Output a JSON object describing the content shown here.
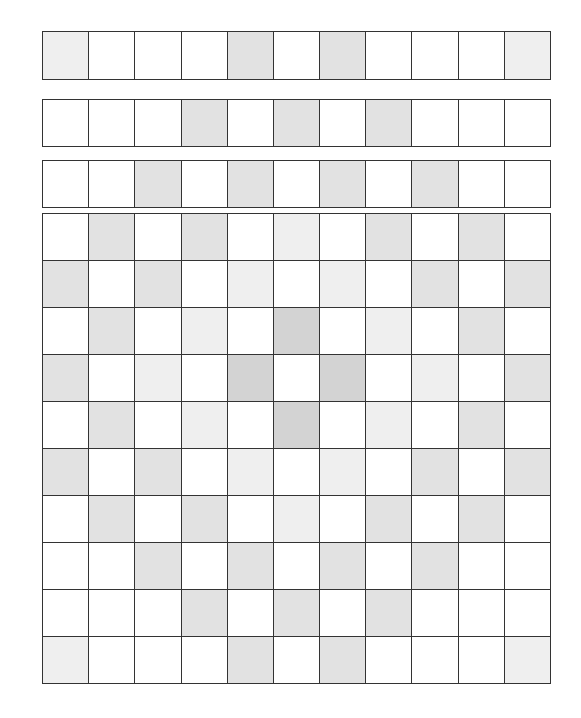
{
  "diagram": {
    "columns": 11,
    "shade_legend": {
      "0": "#ffffff",
      "1": "#efefef",
      "2": "#e2e2e2",
      "3": "#d3d3d3"
    },
    "blocks": [
      {
        "name": "strip-1",
        "top": 31,
        "row_height": 48,
        "rows": [
          [
            1,
            0,
            0,
            0,
            2,
            0,
            2,
            0,
            0,
            0,
            1
          ]
        ]
      },
      {
        "name": "strip-2",
        "top": 99,
        "row_height": 47,
        "rows": [
          [
            0,
            0,
            0,
            2,
            0,
            2,
            0,
            2,
            0,
            0,
            0
          ]
        ]
      },
      {
        "name": "strip-3",
        "top": 160,
        "row_height": 47,
        "rows": [
          [
            0,
            0,
            2,
            0,
            2,
            0,
            2,
            0,
            2,
            0,
            0
          ]
        ]
      },
      {
        "name": "main-grid",
        "top": 213,
        "row_height": 47,
        "rows": [
          [
            0,
            2,
            0,
            2,
            0,
            1,
            0,
            2,
            0,
            2,
            0
          ],
          [
            2,
            0,
            2,
            0,
            1,
            0,
            1,
            0,
            2,
            0,
            2
          ],
          [
            0,
            2,
            0,
            1,
            0,
            3,
            0,
            1,
            0,
            2,
            0
          ],
          [
            2,
            0,
            1,
            0,
            3,
            0,
            3,
            0,
            1,
            0,
            2
          ],
          [
            0,
            2,
            0,
            1,
            0,
            3,
            0,
            1,
            0,
            2,
            0
          ],
          [
            2,
            0,
            2,
            0,
            1,
            0,
            1,
            0,
            2,
            0,
            2
          ],
          [
            0,
            2,
            0,
            2,
            0,
            1,
            0,
            2,
            0,
            2,
            0
          ],
          [
            0,
            0,
            2,
            0,
            2,
            0,
            2,
            0,
            2,
            0,
            0
          ],
          [
            0,
            0,
            0,
            2,
            0,
            2,
            0,
            2,
            0,
            0,
            0
          ],
          [
            1,
            0,
            0,
            0,
            2,
            0,
            2,
            0,
            0,
            0,
            1
          ]
        ]
      }
    ]
  }
}
